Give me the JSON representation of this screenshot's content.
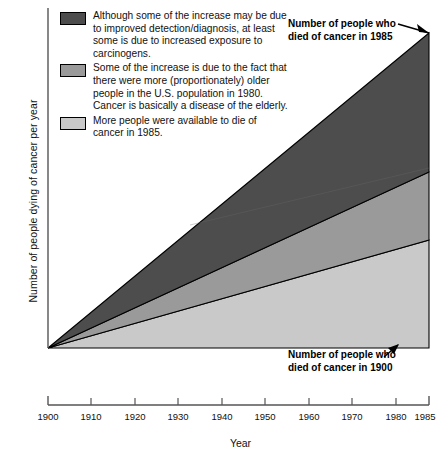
{
  "chart_data": {
    "type": "area",
    "title": "",
    "subtitle": "",
    "xlabel": "Year",
    "ylabel": "Number of people dying of cancer per year",
    "xlim": [
      1900,
      1985
    ],
    "ylim": [
      0,
      100
    ],
    "grid": false,
    "legend_position": "top-left",
    "stacked": true,
    "x": [
      1900,
      1985
    ],
    "series": [
      {
        "name": "More people were available to die of cancer in 1985.",
        "color": "#c9c9c9",
        "values": [
          0,
          31
        ]
      },
      {
        "name": "Some of the increase is due to the fact that there were more (proportionately) older people in the U.S. population in 1980. Cancer is basically a disease of the elderly.",
        "color": "#9a9a9a",
        "values": [
          0,
          22
        ]
      },
      {
        "name": "Although some of the increase may be due to improved detection/diagnosis, at least some is due to increased exposure to carcinogens.",
        "color": "#4d4d4d",
        "values": [
          0,
          47
        ]
      }
    ],
    "annotations": [
      {
        "text": "Number of people who died of cancer in 1985",
        "target_x": 1985,
        "target_y": 100
      },
      {
        "text": "Number of people who died of cancer in 1900",
        "target_x": 1900,
        "target_y": 0
      }
    ],
    "tick_labels": [
      "1900",
      "1910",
      "1920",
      "1930",
      "1940",
      "1950",
      "1960",
      "1970",
      "1980",
      "1985"
    ],
    "tick_values": [
      1900,
      1910,
      1920,
      1930,
      1940,
      1950,
      1960,
      1970,
      1980,
      1985
    ]
  },
  "axes": {
    "y_title": "Number of people dying of cancer per year",
    "x_title": "Year",
    "ticks": [
      {
        "label": "1900",
        "x": 48
      },
      {
        "label": "1910",
        "x": 91
      },
      {
        "label": "1920",
        "x": 135
      },
      {
        "label": "1930",
        "x": 178
      },
      {
        "label": "1940",
        "x": 222
      },
      {
        "label": "1950",
        "x": 265
      },
      {
        "label": "1960",
        "x": 309
      },
      {
        "label": "1970",
        "x": 352
      },
      {
        "label": "1980",
        "x": 396
      },
      {
        "label": "1985",
        "x": 425
      }
    ]
  },
  "legend": {
    "items": [
      {
        "color": "#4d4d4d",
        "text": "Although some of the increase may be due to improved detection/diagnosis, at least some is due to increased exposure to carcinogens."
      },
      {
        "color": "#9a9a9a",
        "text": "Some of the increase is due to the fact that there were more (proportionately) older people in the U.S. population in 1980. Cancer is basically a disease of the elderly."
      },
      {
        "color": "#c9c9c9",
        "text": "More people were available to die of cancer in 1985."
      }
    ]
  },
  "callouts": {
    "top_line1": "Number of people who",
    "top_line2": "died of cancer in 1985",
    "bottom_line1": "Number of people who",
    "bottom_line2": "died of cancer in 1900"
  }
}
